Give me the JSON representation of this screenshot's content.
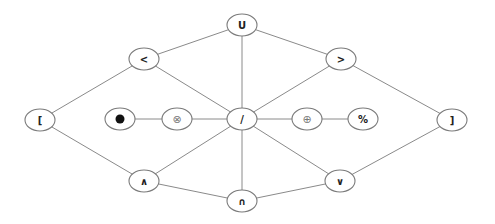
{
  "diagram": {
    "type": "graph",
    "colors": {
      "edge": "#8a8a8a",
      "node_stroke": "#7a7a7a",
      "node_fill": "#ffffff",
      "label": "#222222",
      "filled_dot": "#111111"
    },
    "nodes": [
      {
        "id": "union",
        "label": "U",
        "x": 242,
        "y": 25
      },
      {
        "id": "less",
        "label": "<",
        "x": 144,
        "y": 59
      },
      {
        "id": "greater",
        "label": ">",
        "x": 341,
        "y": 59
      },
      {
        "id": "lbracket",
        "label": "[",
        "x": 40,
        "y": 120
      },
      {
        "id": "bullet",
        "label": "●",
        "x": 120,
        "y": 119
      },
      {
        "id": "otimes",
        "label": "⊗",
        "x": 177,
        "y": 119
      },
      {
        "id": "slash",
        "label": "/",
        "x": 242,
        "y": 119
      },
      {
        "id": "oplus",
        "label": "⊕",
        "x": 307,
        "y": 119
      },
      {
        "id": "percent",
        "label": "%",
        "x": 363,
        "y": 119
      },
      {
        "id": "rbracket",
        "label": "]",
        "x": 452,
        "y": 120
      },
      {
        "id": "wedge",
        "label": "∧",
        "x": 144,
        "y": 181
      },
      {
        "id": "intersection",
        "label": "∩",
        "x": 242,
        "y": 201
      },
      {
        "id": "vee",
        "label": "∨",
        "x": 340,
        "y": 181
      }
    ],
    "edges": [
      [
        "union",
        "less"
      ],
      [
        "union",
        "greater"
      ],
      [
        "union",
        "slash"
      ],
      [
        "less",
        "lbracket"
      ],
      [
        "less",
        "slash"
      ],
      [
        "greater",
        "slash"
      ],
      [
        "greater",
        "rbracket"
      ],
      [
        "lbracket",
        "wedge"
      ],
      [
        "bullet",
        "otimes"
      ],
      [
        "otimes",
        "slash"
      ],
      [
        "slash",
        "oplus"
      ],
      [
        "oplus",
        "percent"
      ],
      [
        "slash",
        "wedge"
      ],
      [
        "slash",
        "intersection"
      ],
      [
        "slash",
        "vee"
      ],
      [
        "wedge",
        "intersection"
      ],
      [
        "intersection",
        "vee"
      ],
      [
        "vee",
        "rbracket"
      ]
    ]
  }
}
